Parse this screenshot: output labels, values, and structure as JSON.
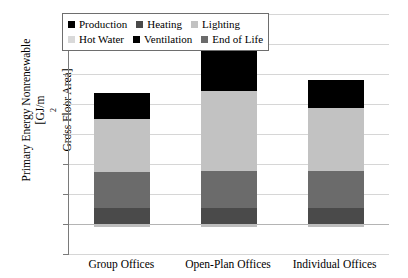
{
  "chart_data": {
    "type": "bar",
    "stacked": true,
    "title": "",
    "xlabel": "",
    "ylabel": "Primary Energy Nonrenewable [GJ/m² Gross Floor Area]",
    "ylabel_line1": "Primary Energy Nonrenewable",
    "ylabel_line2_pre": "[GJ/m",
    "ylabel_line2_sup": "2",
    "ylabel_line2_post": " Gross Floor Area]",
    "categories": [
      "Group Offices",
      "Open-Plan Offices",
      "Individual Offices"
    ],
    "ylim": [
      -5,
      35
    ],
    "ytick_step": 5,
    "yticks": [
      "35",
      "30",
      "25",
      "20",
      "15",
      "10",
      "5",
      "0",
      "-5"
    ],
    "grid": true,
    "legend_position": "top",
    "series": [
      {
        "name": "Heating",
        "color": "#4a4a4a",
        "values": [
          2.7,
          2.7,
          2.6
        ]
      },
      {
        "name": "Ventilation",
        "color": "#6b6b6b",
        "values": [
          6.0,
          6.2,
          6.3
        ]
      },
      {
        "name": "Lighting",
        "color": "#c2c2c2",
        "values": [
          8.8,
          13.2,
          10.5
        ]
      },
      {
        "name": "Production",
        "color": "#000000",
        "values": [
          4.3,
          6.9,
          4.6
        ]
      },
      {
        "name": "Hot Water",
        "color": "#d9d9d9",
        "values": [
          0.0,
          0.0,
          0.0
        ]
      },
      {
        "name": "End of Life",
        "color": "#bdbdbd",
        "values": [
          -0.5,
          -0.5,
          -0.5
        ]
      }
    ],
    "totals": [
      21.8,
      29.0,
      24.0
    ]
  },
  "legend": {
    "rows": [
      [
        {
          "label": "Production",
          "color": "#000000"
        },
        {
          "label": "Heating",
          "color": "#4a4a4a"
        },
        {
          "label": "Lighting",
          "color": "#c2c2c2"
        }
      ],
      [
        {
          "label": "Hot Water",
          "color": "#d9d9d9"
        },
        {
          "label": "Ventilation",
          "color": "#000000"
        },
        {
          "label": "End of Life",
          "color": "#6b6b6b"
        }
      ]
    ]
  }
}
